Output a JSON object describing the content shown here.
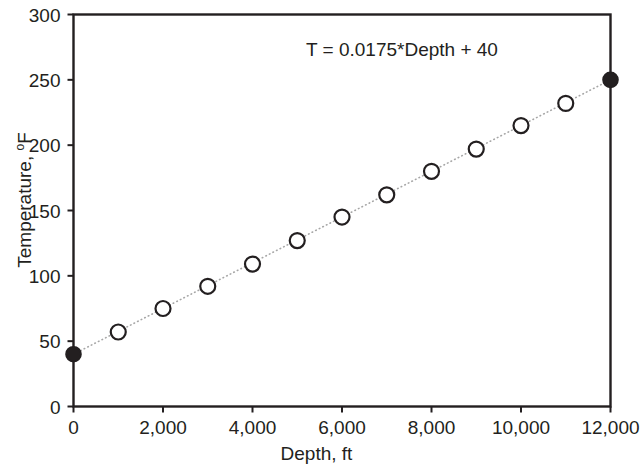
{
  "chart_data": {
    "type": "scatter",
    "title": "",
    "xlabel": "Depth, ft",
    "ylabel": "Temperature, °F",
    "xlim": [
      0,
      12000
    ],
    "ylim": [
      0,
      300
    ],
    "xticks": [
      0,
      2000,
      4000,
      6000,
      8000,
      10000,
      12000
    ],
    "xticklabels": [
      "0",
      "2,000",
      "4,000",
      "6,000",
      "8,000",
      "10,000",
      "12,000"
    ],
    "yticks": [
      0,
      50,
      100,
      150,
      200,
      250,
      300
    ],
    "yticklabels": [
      "0",
      "50",
      "100",
      "150",
      "200",
      "250",
      "300"
    ],
    "grid": false,
    "legend": "none",
    "annotations": [
      {
        "text": "T = 0.0175*Depth + 40",
        "x": 7000,
        "y": 280
      }
    ],
    "trendline": {
      "style": "dotted",
      "color": "#a6a6a6",
      "slope": 0.0175,
      "intercept": 40,
      "x": [
        0,
        12000
      ],
      "y": [
        40,
        250
      ]
    },
    "series": [
      {
        "name": "Temperature vs Depth",
        "marker": "circle-open",
        "marker_color": "#231f20",
        "marker_fill": "#ffffff",
        "x": [
          1000,
          2000,
          3000,
          4000,
          5000,
          6000,
          7000,
          8000,
          9000,
          10000,
          11000
        ],
        "y": [
          57,
          75,
          92,
          109,
          127,
          145,
          162,
          180,
          197,
          215,
          232
        ]
      },
      {
        "name": "Endpoints",
        "marker": "circle-filled",
        "marker_color": "#231f20",
        "marker_fill": "#231f20",
        "x": [
          0,
          12000
        ],
        "y": [
          40,
          250
        ]
      }
    ]
  },
  "axes": {
    "x_title": "Depth, ft",
    "y_title_text": "Temperature, ",
    "y_title_degree": "o",
    "y_title_unit": "F"
  },
  "colors": {
    "axis": "#231f20",
    "marker_edge": "#231f20",
    "marker_face": "#ffffff",
    "endpoint_fill": "#231f20",
    "trendline": "#a6a6a6",
    "background": "#ffffff"
  }
}
